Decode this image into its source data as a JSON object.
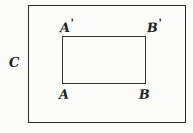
{
  "figure": {
    "type": "geometry-diagram",
    "background_color": "#fbfbfa",
    "stroke_color": "#2a2a2a",
    "text_color": "#232323",
    "shapes": {
      "outer_rectangle": {
        "name": "C",
        "x": 28,
        "y": 5,
        "width": 158,
        "height": 118
      },
      "inner_rectangle": {
        "x": 62,
        "y": 36,
        "width": 84,
        "height": 48,
        "vertices": [
          "A'",
          "B'",
          "A",
          "B"
        ]
      }
    },
    "labels": {
      "outer": "C",
      "top_left": "A",
      "top_left_prime": "'",
      "top_right": "B",
      "top_right_prime": "'",
      "bottom_left": "A",
      "bottom_right": "B"
    }
  }
}
